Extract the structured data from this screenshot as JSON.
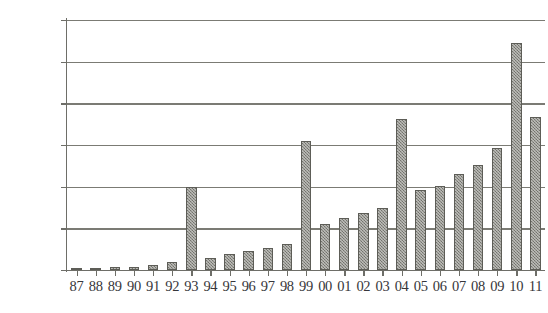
{
  "chart_data": {
    "type": "bar",
    "title": "",
    "subtitle": "",
    "xlabel": "",
    "ylabel": "",
    "categories": [
      "87",
      "88",
      "89",
      "90",
      "91",
      "92",
      "93",
      "94",
      "95",
      "96",
      "97",
      "98",
      "99",
      "00",
      "01",
      "02",
      "03",
      "04",
      "05",
      "06",
      "07",
      "08",
      "09",
      "10",
      "11"
    ],
    "values": [
      2000,
      1500,
      4000,
      3500,
      6000,
      10000,
      100000,
      15000,
      19000,
      23000,
      26000,
      31000,
      155000,
      55000,
      62000,
      69000,
      74000,
      181000,
      96000,
      101000,
      115000,
      126000,
      146000,
      273000,
      184000
    ],
    "ylim": [
      0,
      300000
    ],
    "yticks": [
      0,
      50000,
      100000,
      150000,
      200000,
      250000,
      300000
    ],
    "ytick_labels": [
      "0",
      "50000",
      "100000",
      "150000",
      "200000",
      "250000",
      "300000"
    ],
    "grid": true,
    "legend": null,
    "legend_position": "none",
    "series": [
      {
        "name": "",
        "values": [
          2000,
          1500,
          4000,
          3500,
          6000,
          10000,
          100000,
          15000,
          19000,
          23000,
          26000,
          31000,
          155000,
          55000,
          62000,
          69000,
          74000,
          181000,
          96000,
          101000,
          115000,
          126000,
          146000,
          273000,
          184000
        ]
      }
    ],
    "colors": {
      "bar_fill": "#8b8b84",
      "bar_border": "#5d5d57",
      "gridline": "#7b7b74",
      "axis": "#6e6e68",
      "text": "#36363a",
      "background": "#ffffff"
    }
  }
}
